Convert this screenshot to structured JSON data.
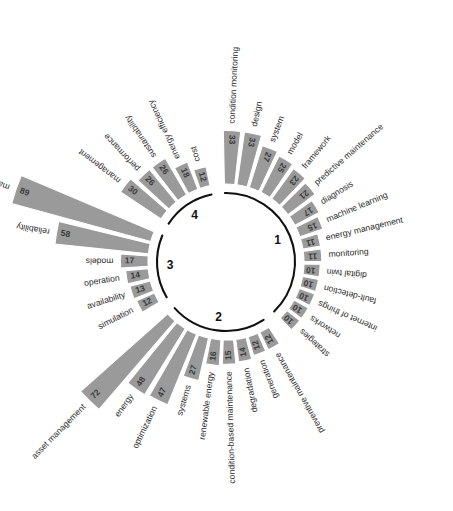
{
  "figure": {
    "background": "#ffffff",
    "bar_color": "#9a9a9a",
    "bar_edge_color": "#ffffff",
    "label_color": "#2b2b2b",
    "arc_color": "#111111"
  },
  "chart_data": {
    "type": "bar",
    "title": "",
    "subtitle": "",
    "xlabel": "",
    "ylabel": "",
    "layout": "circular-bar-chart",
    "grid": false,
    "legend": null,
    "value_range": [
      10,
      89
    ],
    "groups": [
      {
        "id": "1",
        "label": "1",
        "categories": [
          "condition monitoring",
          "design",
          "system",
          "model",
          "framework",
          "predictive maintenance",
          "diagnosis",
          "machine learning",
          "energy management",
          "monitoring",
          "digital twin",
          "fault-detection",
          "internet of things",
          "networks",
          "strategies"
        ],
        "values": [
          33,
          33,
          27,
          25,
          23,
          21,
          17,
          15,
          11,
          11,
          10,
          10,
          10,
          10,
          10
        ]
      },
      {
        "id": "2",
        "label": "2",
        "categories": [
          "preventive maintenance",
          "generation",
          "degradation",
          "condition-based maintenance",
          "renewable energy",
          "systems",
          "optimization",
          "energy",
          "asset management"
        ],
        "values": [
          12,
          12,
          14,
          15,
          16,
          27,
          47,
          48,
          72
        ]
      },
      {
        "id": "3",
        "label": "3",
        "categories": [
          "simulation",
          "availability",
          "operation",
          "models",
          "reliability",
          "maintenance"
        ],
        "values": [
          12,
          13,
          14,
          17,
          58,
          89
        ]
      },
      {
        "id": "4",
        "label": "4",
        "categories": [
          "management",
          "performance",
          "sustainability",
          "energy efficiency",
          "cost"
        ],
        "values": [
          30,
          26,
          26,
          18,
          12
        ]
      }
    ]
  }
}
